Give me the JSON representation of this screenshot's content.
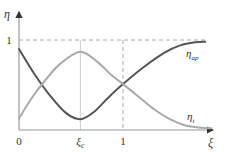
{
  "chart_data": {
    "type": "line",
    "title": "",
    "xlabel": "ξ",
    "ylabel": "η",
    "xlim": [
      0,
      1.9
    ],
    "ylim": [
      0,
      1.2
    ],
    "grid": false,
    "x_ticks": [
      {
        "value": 0,
        "label": "0"
      },
      {
        "value": 0.59,
        "label": "ξ",
        "sub": "c"
      },
      {
        "value": 1,
        "label": "1"
      }
    ],
    "y_ticks": [
      {
        "value": 1,
        "label": "1"
      }
    ],
    "reference_lines": [
      {
        "orientation": "horizontal",
        "value": 1,
        "style": "dashed"
      },
      {
        "orientation": "vertical",
        "value": 0.59,
        "style": "solid-light"
      },
      {
        "orientation": "vertical",
        "value": 1,
        "style": "dashed"
      }
    ],
    "series": [
      {
        "name": "η_ap",
        "label": "η",
        "sub": "ap",
        "color": "#555555",
        "points": [
          [
            0,
            0.9
          ],
          [
            0.15,
            0.62
          ],
          [
            0.3,
            0.38
          ],
          [
            0.45,
            0.19
          ],
          [
            0.59,
            0.12
          ],
          [
            0.72,
            0.2
          ],
          [
            0.85,
            0.35
          ],
          [
            1.0,
            0.51
          ],
          [
            1.2,
            0.7
          ],
          [
            1.4,
            0.86
          ],
          [
            1.55,
            0.94
          ],
          [
            1.7,
            0.975
          ],
          [
            1.79,
            0.98
          ]
        ]
      },
      {
        "name": "η_t",
        "label": "η",
        "sub": "t",
        "color": "#aaaaaa",
        "points": [
          [
            0,
            0.13
          ],
          [
            0.12,
            0.35
          ],
          [
            0.25,
            0.55
          ],
          [
            0.4,
            0.74
          ],
          [
            0.59,
            0.87
          ],
          [
            0.75,
            0.76
          ],
          [
            0.88,
            0.62
          ],
          [
            1.0,
            0.51
          ],
          [
            1.15,
            0.37
          ],
          [
            1.3,
            0.23
          ],
          [
            1.45,
            0.12
          ],
          [
            1.6,
            0.05
          ],
          [
            1.75,
            0.025
          ],
          [
            1.85,
            0.02
          ]
        ]
      }
    ]
  }
}
